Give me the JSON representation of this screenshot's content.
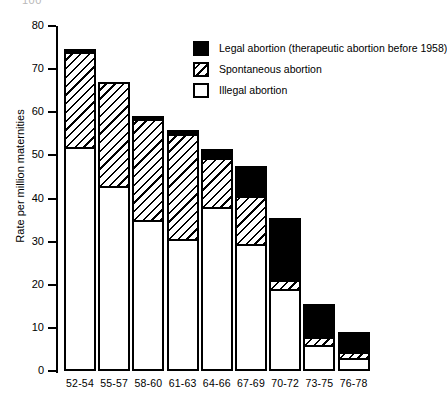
{
  "top_artifact": "100",
  "chart_data": {
    "type": "bar",
    "stacked": true,
    "title": "",
    "xlabel": "",
    "ylabel": "Rate per million maternities",
    "ylim": [
      0,
      80
    ],
    "ytick_step": 10,
    "yticks": [
      "0",
      "10",
      "20",
      "30",
      "40",
      "50",
      "60",
      "70",
      "80"
    ],
    "grid": false,
    "legend_position": "upper-right-inside",
    "categories": [
      "52-54",
      "55-57",
      "58-60",
      "61-63",
      "64-66",
      "67-69",
      "70-72",
      "73-75",
      "76-78"
    ],
    "series": [
      {
        "name": "Illegal abortion",
        "style": "white",
        "values": [
          52.0,
          43.0,
          35.0,
          30.5,
          38.0,
          29.5,
          19.0,
          6.0,
          3.0
        ]
      },
      {
        "name": "Spontaneous abortion",
        "style": "hatched",
        "values": [
          22.0,
          24.0,
          23.5,
          24.5,
          11.5,
          11.0,
          2.0,
          2.0,
          1.5
        ]
      },
      {
        "name": "Legal abortion (therapeutic abortion before 1958)",
        "style": "black",
        "values": [
          0.7,
          0.0,
          0.7,
          1.0,
          2.0,
          7.0,
          14.5,
          7.5,
          4.5
        ]
      }
    ],
    "totals": [
      74.7,
      67.0,
      59.2,
      56.0,
      51.5,
      47.5,
      35.5,
      15.5,
      9.0
    ],
    "legend": [
      {
        "label": "Legal abortion (therapeutic abortion before 1958)",
        "style": "black"
      },
      {
        "label": "Spontaneous abortion",
        "style": "hatched"
      },
      {
        "label": "Illegal abortion",
        "style": "white"
      }
    ],
    "colors": {
      "ink": "#000000",
      "background": "#ffffff"
    }
  }
}
